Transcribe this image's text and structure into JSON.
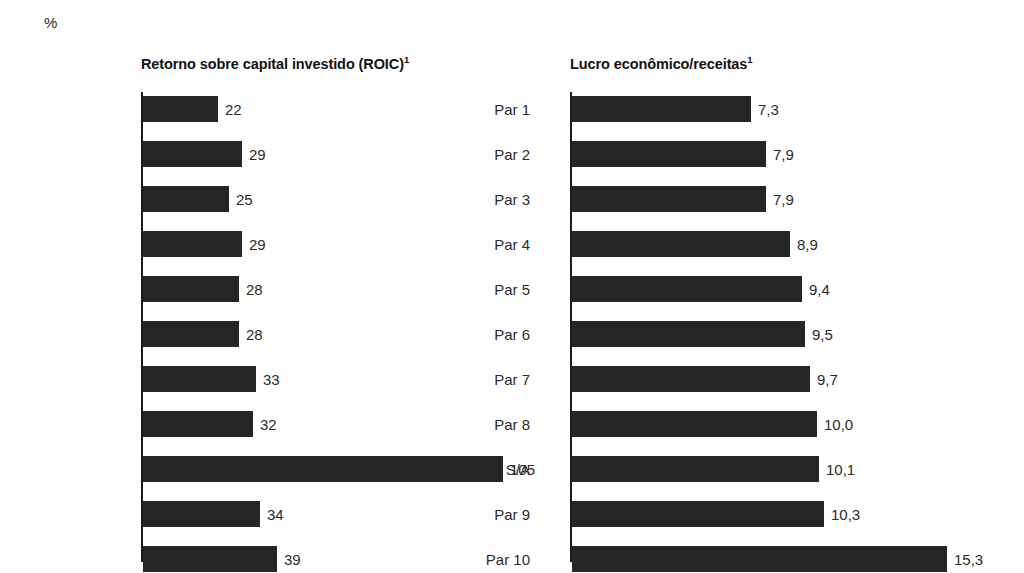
{
  "unit": "%",
  "chart_data": [
    {
      "type": "bar",
      "orientation": "horizontal",
      "panel_id": "roic",
      "title": "Retorno sobre capital investido (ROIC)",
      "title_superscript": "1",
      "xlabel": "",
      "ylabel": "",
      "unit": "%",
      "grid": false,
      "legend": "none",
      "axis_at_zero": true,
      "xlim": [
        0,
        105
      ],
      "categories": [
        "Par 1",
        "Par 2",
        "Par 3",
        "Par 4",
        "Par 5",
        "Par 6",
        "Par 7",
        "Par 8",
        "Retorno S/A",
        "Par 9",
        "Par 10"
      ],
      "values": [
        22,
        29,
        25,
        29,
        28,
        28,
        33,
        32,
        105,
        34,
        39
      ],
      "value_labels": [
        "22",
        "29",
        "25",
        "29",
        "28",
        "28",
        "33",
        "32",
        "105",
        "34",
        "39"
      ],
      "bar_color": "#262626"
    },
    {
      "type": "bar",
      "orientation": "horizontal",
      "panel_id": "lucro-economico-receitas",
      "title": "Lucro econômico/receitas",
      "title_superscript": "1",
      "xlabel": "",
      "ylabel": "",
      "unit": "%",
      "grid": false,
      "legend": "none",
      "axis_at_zero": true,
      "xlim": [
        0,
        15.3
      ],
      "categories": [
        "",
        "",
        "",
        "",
        "",
        "",
        "",
        "",
        "",
        "",
        ""
      ],
      "values": [
        7.3,
        7.9,
        7.9,
        8.9,
        9.4,
        9.5,
        9.7,
        10.0,
        10.1,
        10.3,
        15.3
      ],
      "value_labels": [
        "7,3",
        "7,9",
        "7,9",
        "8,9",
        "9,4",
        "9,5",
        "9,7",
        "10,0",
        "10,1",
        "10,3",
        "15,3"
      ],
      "bar_color": "#262626"
    }
  ]
}
